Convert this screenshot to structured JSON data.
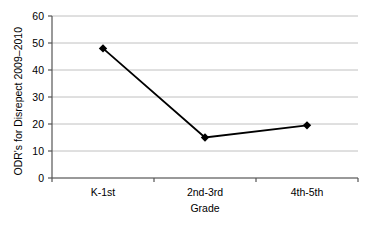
{
  "chart_data": {
    "type": "line",
    "title": "",
    "xlabel": "Grade",
    "ylabel": "ODR's for Disrepect 2009–2010",
    "categories": [
      "K-1st",
      "2nd-3rd",
      "4th-5th"
    ],
    "values": [
      48,
      15,
      19.5
    ],
    "series": [
      {
        "name": "ODR's for Disrepect 2009–2010",
        "values": [
          48,
          15,
          19.5
        ]
      }
    ],
    "ylim": [
      0,
      60
    ],
    "yticks": [
      "0",
      "10",
      "20",
      "30",
      "40",
      "50",
      "60"
    ],
    "ytick_values": [
      0,
      10,
      20,
      30,
      40,
      50,
      60
    ],
    "grid": "horizontal",
    "legend": "none",
    "marker": "diamond",
    "line_color": "#000000",
    "marker_color": "#000000",
    "grid_color": "#c0c0c0",
    "axis_color": "#555555",
    "background": "#ffffff"
  }
}
